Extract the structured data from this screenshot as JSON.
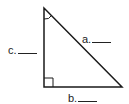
{
  "diagram": {
    "type": "right-triangle",
    "vertices": {
      "top": [
        44,
        8
      ],
      "right_angle": [
        44,
        87
      ],
      "bottom_right": [
        122,
        87
      ]
    },
    "right_angle_marker": true,
    "angle_arc_at": "top",
    "stroke_color": "#1a1a1a"
  },
  "labels": {
    "a": "a.",
    "b": "b.",
    "c": "c."
  }
}
